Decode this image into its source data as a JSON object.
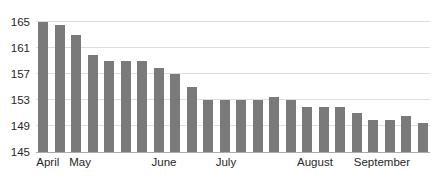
{
  "chart_data": {
    "type": "bar",
    "title": "",
    "xlabel": "",
    "ylabel": "",
    "values": [
      165,
      164.5,
      163,
      160,
      159,
      159,
      159,
      158,
      157,
      155,
      153,
      153,
      153,
      153,
      153.5,
      153,
      152,
      152,
      152,
      151,
      150,
      150,
      150.5,
      149.5
    ],
    "x_axis": {
      "labels": [
        {
          "text": "April",
          "pos": 0.03
        },
        {
          "text": "May",
          "pos": 0.112
        },
        {
          "text": "June",
          "pos": 0.325
        },
        {
          "text": "July",
          "pos": 0.482
        },
        {
          "text": "August",
          "pos": 0.708
        },
        {
          "text": "September",
          "pos": 0.878
        }
      ]
    },
    "y_axis": {
      "min": 145,
      "max": 165,
      "step": 4,
      "ticks": [
        145,
        149,
        153,
        157,
        161,
        165
      ]
    },
    "ylim": [
      145,
      165
    ],
    "grid": true,
    "legend": false,
    "bar_color": "#7a7a7a",
    "gridline_color": "#dedede",
    "axis_line_color": "#ababab",
    "axis_text_color": "#262626"
  }
}
